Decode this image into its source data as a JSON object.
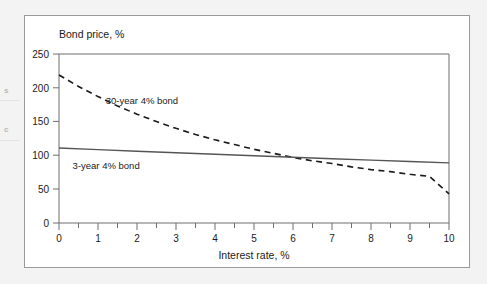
{
  "figure": {
    "background_color": "#ffffff",
    "page_background_color": "#f3f3f3",
    "border_color": "#9a9a9a"
  },
  "margin_bleed": {
    "fragment_1": "s",
    "fragment_2": "c"
  },
  "chart_data": {
    "type": "line",
    "title": "",
    "subtitle": "",
    "xlabel": "Interest rate, %",
    "ylabel": "Bond price, %",
    "xlim": [
      0,
      10
    ],
    "ylim": [
      0,
      250
    ],
    "grid": false,
    "legend_position": "inline-annotation",
    "x_ticks": [
      0,
      1,
      2,
      3,
      4,
      5,
      6,
      7,
      8,
      9,
      10
    ],
    "x_tick_labels": [
      "0",
      "1",
      "2",
      "3",
      "4",
      "5",
      "6",
      "7",
      "8",
      "9",
      "10"
    ],
    "x_minor_ticks": [
      0.5,
      1.5,
      2.5,
      3.5,
      4.5,
      5.5,
      6.5,
      7.5,
      8.5,
      9.5
    ],
    "y_ticks": [
      0,
      50,
      100,
      150,
      200,
      250
    ],
    "y_tick_labels": [
      "0",
      "50",
      "100",
      "150",
      "200",
      "250"
    ],
    "series": [
      {
        "name": "30-year 4% bond",
        "style": "dashed",
        "color": "#1a1a1a",
        "annotation": "30-year 4% bond",
        "x": [
          0,
          0.5,
          1,
          1.5,
          2,
          2.5,
          3,
          3.5,
          4,
          4.5,
          5,
          5.5,
          6,
          6.5,
          7,
          7.5,
          8,
          8.5,
          9,
          9.5,
          10
        ],
        "values": [
          219,
          202,
          187,
          173,
          161,
          150,
          140,
          131,
          123,
          116,
          109,
          103,
          97,
          92,
          88,
          83,
          79,
          76,
          72,
          69,
          43
        ]
      },
      {
        "name": "3-year 4% bond",
        "style": "solid",
        "color": "#555555",
        "annotation": "3-year 4% bond",
        "x": [
          0,
          1,
          2,
          3,
          4,
          5,
          6,
          7,
          8,
          9,
          10
        ],
        "values": [
          111,
          108.6,
          106.2,
          103.9,
          101.6,
          99.4,
          97.2,
          95.1,
          93.0,
          91.0,
          89.0
        ]
      }
    ],
    "annotations": [
      {
        "text": "30-year 4% bond",
        "x": 1.2,
        "y": 176
      },
      {
        "text": "3-year 4% bond",
        "x": 0.35,
        "y": 80
      }
    ]
  }
}
